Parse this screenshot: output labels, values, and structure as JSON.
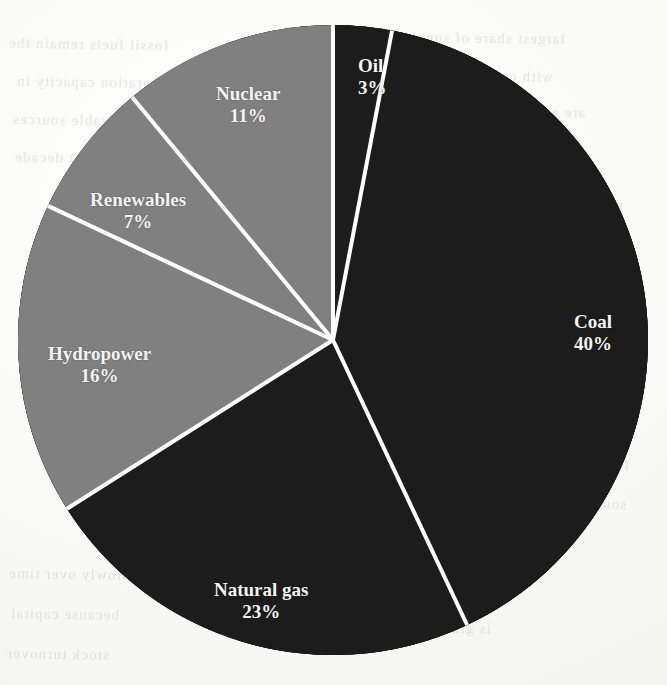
{
  "chart_data": {
    "type": "pie",
    "title": "",
    "subtitle": "",
    "xlabel": "",
    "ylabel": "",
    "legend_position": "none",
    "grid": false,
    "labels_inside_slices": true,
    "start_angle_deg": 0,
    "direction": "clockwise",
    "categories": [
      "Oil",
      "Coal",
      "Natural gas",
      "Hydropower",
      "Renewables",
      "Nuclear"
    ],
    "values": [
      3,
      40,
      23,
      16,
      7,
      11
    ],
    "value_unit": "%",
    "total": 100,
    "slices": [
      {
        "name": "Oil",
        "value": 3,
        "value_label": "3%",
        "fill": "#1a1a1a",
        "tone": "dark",
        "text_color": "#f4f4f2",
        "start_deg": 0.0,
        "end_deg": 10.8
      },
      {
        "name": "Coal",
        "value": 40,
        "value_label": "40%",
        "fill": "#1a1a1a",
        "tone": "dark",
        "text_color": "#f4f4f2",
        "start_deg": 10.8,
        "end_deg": 154.8
      },
      {
        "name": "Natural gas",
        "value": 23,
        "value_label": "23%",
        "fill": "#1a1a1a",
        "tone": "dark",
        "text_color": "#f4f4f2",
        "start_deg": 154.8,
        "end_deg": 237.6
      },
      {
        "name": "Hydropower",
        "value": 16,
        "value_label": "16%",
        "fill": "#808080",
        "tone": "gray",
        "text_color": "#f4f4f2",
        "start_deg": 237.6,
        "end_deg": 295.2
      },
      {
        "name": "Renewables",
        "value": 7,
        "value_label": "7%",
        "fill": "#808080",
        "tone": "gray",
        "text_color": "#f4f4f2",
        "start_deg": 295.2,
        "end_deg": 320.4
      },
      {
        "name": "Nuclear",
        "value": 11,
        "value_label": "11%",
        "fill": "#808080",
        "tone": "gray",
        "text_color": "#f4f4f2",
        "start_deg": 320.4,
        "end_deg": 360.0
      }
    ],
    "geometry": {
      "center_x": 333,
      "center_y": 340,
      "radius": 315,
      "divider_color": "#ffffff",
      "divider_width_px": 4
    },
    "colors": {
      "dark_slice": "#1a1a1a",
      "gray_slice": "#808080",
      "divider": "#ffffff",
      "label_text": "#f4f4f2",
      "page_background": "#fbfbfa"
    }
  },
  "labels": {
    "oil": {
      "name": "Oil",
      "pct": "3%"
    },
    "coal": {
      "name": "Coal",
      "pct": "40%"
    },
    "gas": {
      "name": "Natural gas",
      "pct": "23%"
    },
    "hydropower": {
      "name": "Hydropower",
      "pct": "16%"
    },
    "renewables": {
      "name": "Renewables",
      "pct": "7%"
    },
    "nuclear": {
      "name": "Nuclear",
      "pct": "11%"
    }
  },
  "background": {
    "description": "faint mirrored bleed-through text from the reverse side of the scanned page",
    "ghost_lines": [
      {
        "text": "fossil fuels remain the",
        "x": 8,
        "y": 36,
        "size": 15,
        "rotate": -1.0
      },
      {
        "text": "largest share of supply",
        "x": 402,
        "y": 30,
        "size": 15,
        "rotate": -0.6
      },
      {
        "text": "generation capacity in",
        "x": 16,
        "y": 74,
        "size": 15,
        "rotate": -0.8
      },
      {
        "text": "with coal and gas",
        "x": 428,
        "y": 68,
        "size": 15,
        "rotate": -0.5
      },
      {
        "text": "renewable sources",
        "x": 12,
        "y": 112,
        "size": 15,
        "rotate": -0.9
      },
      {
        "text": "are expected to grow",
        "x": 436,
        "y": 104,
        "size": 15,
        "rotate": -0.4
      },
      {
        "text": "over the next decade",
        "x": 14,
        "y": 150,
        "size": 15,
        "rotate": -0.7
      },
      {
        "text": "as costs decline",
        "x": 478,
        "y": 146,
        "size": 15,
        "rotate": -0.5
      },
      {
        "text": "nuclear output",
        "x": 520,
        "y": 196,
        "size": 15,
        "rotate": -0.6
      },
      {
        "text": "hydropower",
        "x": 548,
        "y": 246,
        "size": 15,
        "rotate": -0.5
      },
      {
        "text": "the mix of",
        "x": 566,
        "y": 412,
        "size": 15,
        "rotate": -0.4
      },
      {
        "text": "primary energy",
        "x": 520,
        "y": 454,
        "size": 15,
        "rotate": -0.6
      },
      {
        "text": "sources shifts",
        "x": 528,
        "y": 496,
        "size": 15,
        "rotate": -0.5
      },
      {
        "text": "slowly over time",
        "x": 8,
        "y": 566,
        "size": 15,
        "rotate": -0.8
      },
      {
        "text": "because capital",
        "x": 10,
        "y": 606,
        "size": 15,
        "rotate": -0.7
      },
      {
        "text": "stock turnover",
        "x": 6,
        "y": 646,
        "size": 15,
        "rotate": -0.9
      },
      {
        "text": "is gradual",
        "x": 420,
        "y": 620,
        "size": 15,
        "rotate": -0.5
      }
    ]
  }
}
